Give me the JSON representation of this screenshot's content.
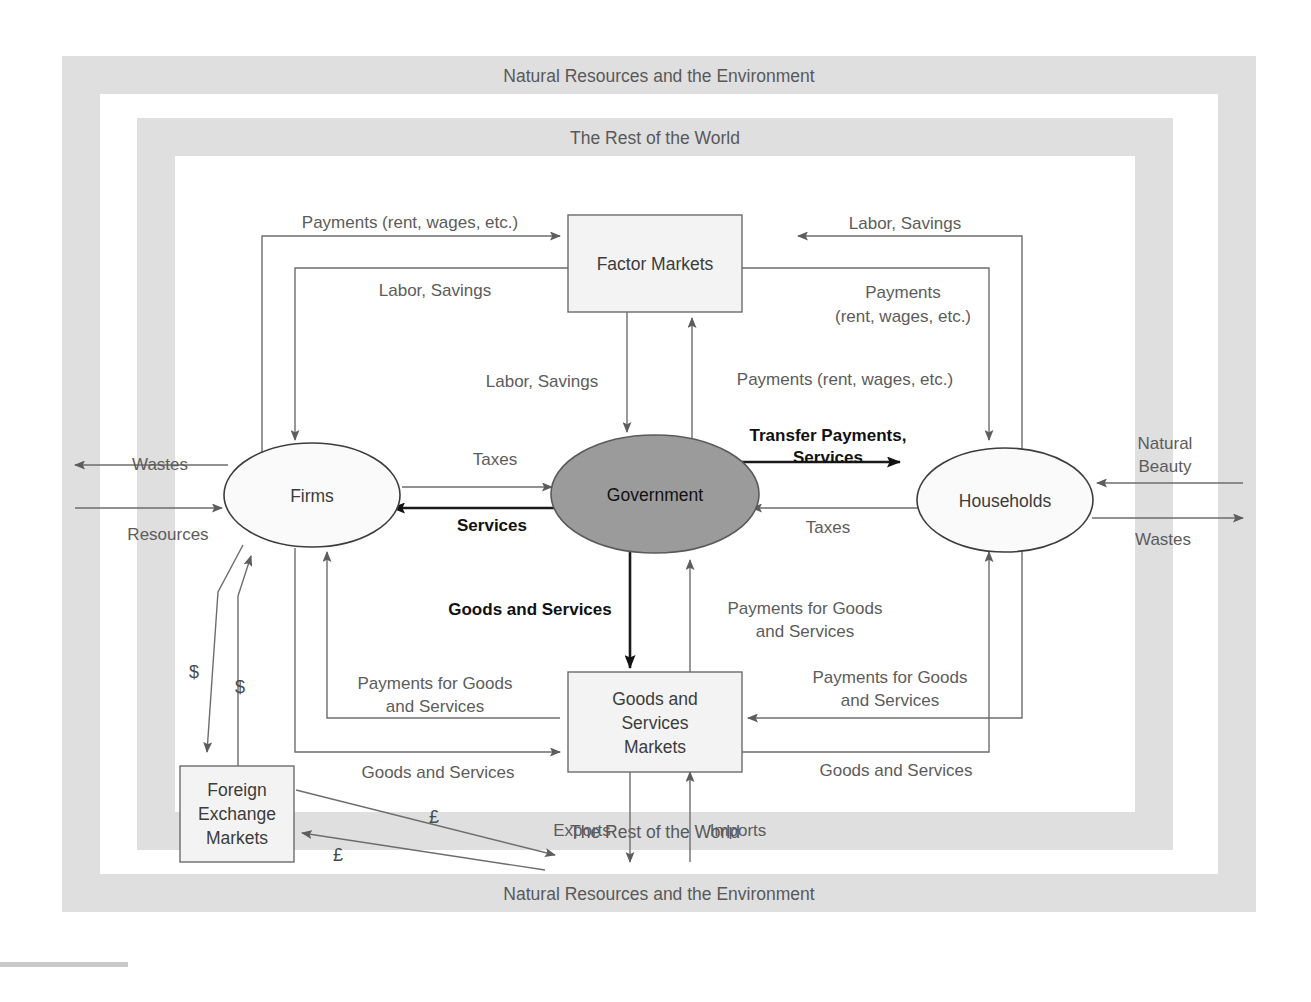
{
  "frames": {
    "outer_label_top": "Natural Resources and the Environment",
    "outer_label_bottom": "Natural Resources and the Environment",
    "inner_label_top": "The Rest of the World",
    "inner_label_bottom": "The Rest of the World",
    "band_color": "#dfdfe0"
  },
  "nodes": {
    "factor_markets": {
      "label": "Factor Markets",
      "shape": "box"
    },
    "goods_markets": {
      "label_line1": "Goods and",
      "label_line2": "Services",
      "label_line3": "Markets",
      "shape": "box"
    },
    "foreign_exchange": {
      "label_line1": "Foreign",
      "label_line2": "Exchange",
      "label_line3": "Markets",
      "shape": "box"
    },
    "firms": {
      "label": "Firms",
      "shape": "ellipse"
    },
    "households": {
      "label": "Households",
      "shape": "ellipse"
    },
    "government": {
      "label": "Government",
      "shape": "ellipse",
      "fill": "#9b9b9b"
    }
  },
  "flows": {
    "firms_to_factor_payments": "Payments (rent, wages, etc.)",
    "factor_to_firms_labor": "Labor, Savings",
    "households_to_factor_labor": "Labor, Savings",
    "factor_to_households_payments_l1": "Payments",
    "factor_to_households_payments_l2": "(rent, wages, etc.)",
    "factor_down_labor": "Labor, Savings",
    "gov_up_payments": "Payments (rent, wages, etc.)",
    "firms_to_gov_taxes": "Taxes",
    "gov_to_firms_services": "Services",
    "gov_to_households_transfer_l1": "Transfer Payments,",
    "gov_to_households_transfer_l2": "Services",
    "households_to_gov_taxes": "Taxes",
    "gov_to_goods_services": "Goods and Services",
    "goods_to_gov_payments_l1": "Payments for Goods",
    "goods_to_gov_payments_l2": "and Services",
    "firms_payments_goods_l1": "Payments for Goods",
    "firms_payments_goods_l2": "and Services",
    "households_payments_goods_l1": "Payments for Goods",
    "households_payments_goods_l2": "and Services",
    "firms_goods_services": "Goods and Services",
    "households_goods_services": "Goods and Services",
    "firms_wastes": "Wastes",
    "firms_resources": "Resources",
    "households_natural_beauty_l1": "Natural",
    "households_natural_beauty_l2": "Beauty",
    "households_wastes": "Wastes",
    "exports": "Exports",
    "imports": "Imports",
    "dollar_out": "$",
    "dollar_in": "$",
    "pound_out": "£",
    "pound_in": "£"
  }
}
